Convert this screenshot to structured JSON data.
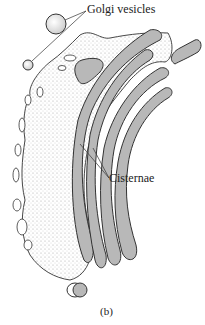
{
  "figure": {
    "caption": "(b)",
    "labels": {
      "golgi_vesicles": "Golgi vesicles",
      "cisternae": "Cisternae"
    },
    "colors": {
      "cisterna_fill": "#b8b8b8",
      "outline": "#333333",
      "stipple": "#dcdcdc",
      "background": "#ffffff"
    }
  }
}
